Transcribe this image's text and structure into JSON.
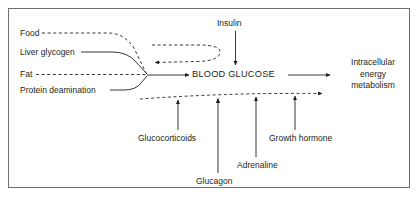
{
  "figure": {
    "type": "flow-diagram",
    "border_color": "#6d6e71",
    "line_color": "#231f20",
    "text_color": "#231f20"
  },
  "nodes": {
    "center": "BLOOD GLUCOSE",
    "inputs": [
      {
        "label": "Food",
        "line_style": "dashed"
      },
      {
        "label": "Liver glycogen",
        "line_style": "solid"
      },
      {
        "label": "Fat",
        "line_style": "dashed"
      },
      {
        "label": "Protein deamination",
        "line_style": "solid"
      }
    ],
    "top": {
      "label": "Insulin",
      "line_style": "solid",
      "direction": "down"
    },
    "output": {
      "line1": "Intracellular",
      "line2": "energy",
      "line3": "metabolism"
    },
    "bottom": [
      {
        "label": "Glucocorticoids",
        "line_style": "solid",
        "direction": "up"
      },
      {
        "label": "Glucagon",
        "line_style": "solid",
        "direction": "up"
      },
      {
        "label": "Adrenaline",
        "line_style": "solid",
        "direction": "up"
      },
      {
        "label": "Growth hormone",
        "line_style": "solid",
        "direction": "up"
      }
    ]
  },
  "connectors": {
    "feedback_upper": {
      "style": "dashed",
      "direction": "left",
      "note": "insulin feedback loop returning to blood glucose inputs"
    },
    "feedback_lower": {
      "style": "dashed",
      "direction": "right",
      "note": "counter-regulatory hormone line to intracellular energy metabolism"
    },
    "main_output": {
      "style": "solid",
      "direction": "right"
    }
  }
}
